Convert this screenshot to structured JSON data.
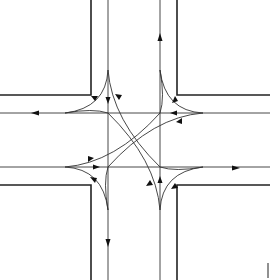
{
  "diagram": {
    "type": "traffic-intersection-movements",
    "colors": {
      "background": "#ffffff",
      "line": "#333333",
      "curb": "#222222"
    },
    "approaches": [
      {
        "name": "north",
        "inbound_direction": "southbound",
        "outbound_direction": "northbound"
      },
      {
        "name": "south",
        "inbound_direction": "northbound",
        "outbound_direction": "southbound"
      },
      {
        "name": "west",
        "inbound_direction": "eastbound",
        "outbound_direction": "westbound"
      },
      {
        "name": "east",
        "inbound_direction": "westbound",
        "outbound_direction": "eastbound"
      }
    ],
    "corner_mark": ""
  }
}
